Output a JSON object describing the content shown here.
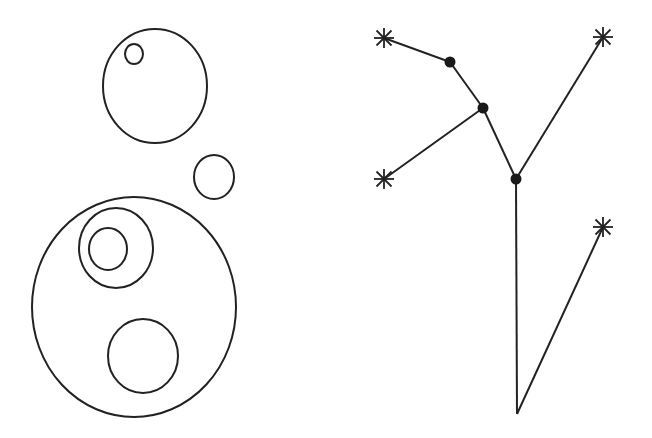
{
  "diagram": {
    "colors": {
      "background": "#ffffff",
      "stroke": "#222222",
      "node_fill": "#1a1a1a"
    },
    "circles_panel": {
      "ellipses": [
        {
          "id": "top-circle",
          "cx": 155,
          "cy": 86,
          "rx": 52,
          "ry": 57
        },
        {
          "id": "top-small-circle",
          "cx": 134,
          "cy": 54,
          "rx": 9,
          "ry": 10
        },
        {
          "id": "side-circle",
          "cx": 214,
          "cy": 177,
          "rx": 20,
          "ry": 22
        },
        {
          "id": "big-circle",
          "cx": 134,
          "cy": 307,
          "rx": 102,
          "ry": 110
        },
        {
          "id": "ring-outer-circle",
          "cx": 116,
          "cy": 248,
          "rx": 37,
          "ry": 40
        },
        {
          "id": "ring-inner-circle",
          "cx": 108,
          "cy": 249,
          "rx": 19,
          "ry": 21
        },
        {
          "id": "lower-circle",
          "cx": 143,
          "cy": 356,
          "rx": 35,
          "ry": 37
        }
      ]
    },
    "tree_panel": {
      "nodes": [
        {
          "id": "node-a",
          "x": 450,
          "y": 62,
          "kind": "dot"
        },
        {
          "id": "node-b",
          "x": 483,
          "y": 108,
          "kind": "dot"
        },
        {
          "id": "node-c",
          "x": 516,
          "y": 179,
          "kind": "dot"
        },
        {
          "id": "root",
          "x": 517,
          "y": 414,
          "kind": "none"
        },
        {
          "id": "leaf-1",
          "x": 384,
          "y": 38,
          "kind": "star"
        },
        {
          "id": "leaf-2",
          "x": 384,
          "y": 179,
          "kind": "star"
        },
        {
          "id": "leaf-3",
          "x": 603,
          "y": 37,
          "kind": "star"
        },
        {
          "id": "leaf-4",
          "x": 603,
          "y": 227,
          "kind": "star"
        }
      ],
      "edges": [
        {
          "from": "leaf-1",
          "to": "node-a"
        },
        {
          "from": "node-a",
          "to": "node-b"
        },
        {
          "from": "node-b",
          "to": "leaf-2"
        },
        {
          "from": "node-b",
          "to": "node-c"
        },
        {
          "from": "node-c",
          "to": "leaf-3"
        },
        {
          "from": "node-c",
          "to": "root"
        },
        {
          "from": "root",
          "to": "leaf-4"
        }
      ]
    }
  }
}
